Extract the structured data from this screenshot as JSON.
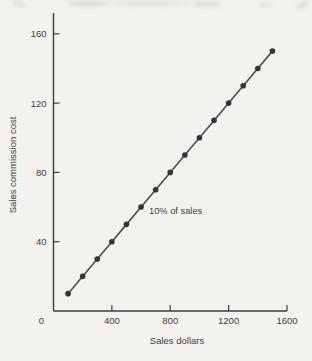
{
  "figure": {
    "background": "#f3f2ef",
    "ink_color": "#3d3d3d"
  },
  "chart_data": {
    "type": "line",
    "title": "",
    "xlabel": "Sales dollars",
    "ylabel": "Sales commission cost",
    "annotation": "10% of sales",
    "x": [
      100,
      200,
      300,
      400,
      500,
      600,
      700,
      800,
      900,
      1000,
      1100,
      1200,
      1300,
      1400,
      1500
    ],
    "y": [
      10,
      20,
      30,
      40,
      50,
      60,
      70,
      80,
      90,
      100,
      110,
      120,
      130,
      140,
      150
    ],
    "x_ticks": [
      0,
      400,
      800,
      1200,
      1600
    ],
    "y_ticks": [
      40,
      80,
      120,
      160
    ],
    "xlim": [
      0,
      1600
    ],
    "ylim": [
      0,
      172
    ],
    "grid": false,
    "legend": "none",
    "line_color": "#4d4d4d",
    "marker_color": "#343434",
    "axis_color": "#3d3d3d"
  }
}
